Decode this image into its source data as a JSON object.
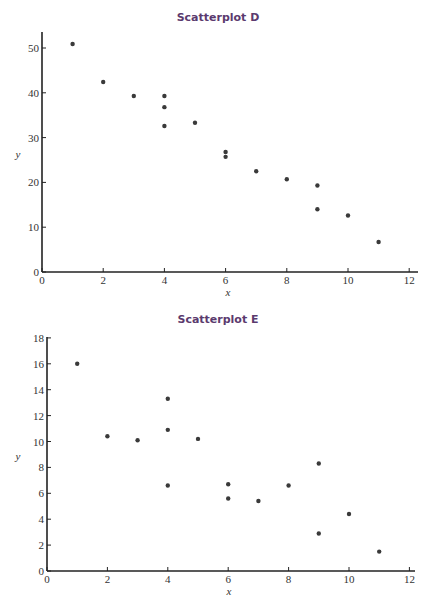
{
  "chart_data": [
    {
      "type": "scatter",
      "title": "Scatterplot D",
      "xlabel": "x",
      "ylabel": "y",
      "xlim": [
        0,
        12
      ],
      "ylim": [
        0,
        53
      ],
      "xticks": [
        0,
        2,
        4,
        6,
        8,
        10,
        12
      ],
      "yticks": [
        0,
        10,
        20,
        30,
        40,
        50
      ],
      "grid": false,
      "points": [
        {
          "x": 1,
          "y": 50.9
        },
        {
          "x": 2,
          "y": 42.4
        },
        {
          "x": 3,
          "y": 39.3
        },
        {
          "x": 4,
          "y": 39.3
        },
        {
          "x": 4,
          "y": 36.8
        },
        {
          "x": 4,
          "y": 32.6
        },
        {
          "x": 5,
          "y": 33.3
        },
        {
          "x": 6,
          "y": 26.8
        },
        {
          "x": 6,
          "y": 25.7
        },
        {
          "x": 7,
          "y": 22.5
        },
        {
          "x": 8,
          "y": 20.7
        },
        {
          "x": 9,
          "y": 19.3
        },
        {
          "x": 9,
          "y": 14.0
        },
        {
          "x": 10,
          "y": 12.6
        },
        {
          "x": 11,
          "y": 6.7
        }
      ]
    },
    {
      "type": "scatter",
      "title": "Scatterplot E",
      "xlabel": "x",
      "ylabel": "y",
      "xlim": [
        0,
        12
      ],
      "ylim": [
        0,
        18
      ],
      "xticks": [
        0,
        2,
        4,
        6,
        8,
        10,
        12
      ],
      "yticks": [
        0,
        2,
        4,
        6,
        8,
        10,
        12,
        14,
        16,
        18
      ],
      "grid": false,
      "points": [
        {
          "x": 1,
          "y": 16.0
        },
        {
          "x": 2,
          "y": 10.4
        },
        {
          "x": 3,
          "y": 10.1
        },
        {
          "x": 4,
          "y": 13.3
        },
        {
          "x": 4,
          "y": 10.9
        },
        {
          "x": 4,
          "y": 6.6
        },
        {
          "x": 5,
          "y": 10.2
        },
        {
          "x": 6,
          "y": 6.7
        },
        {
          "x": 6,
          "y": 5.6
        },
        {
          "x": 7,
          "y": 5.4
        },
        {
          "x": 8,
          "y": 6.6
        },
        {
          "x": 9,
          "y": 8.3
        },
        {
          "x": 9,
          "y": 2.9
        },
        {
          "x": 10,
          "y": 4.4
        },
        {
          "x": 11,
          "y": 1.5
        }
      ]
    }
  ],
  "colors": {
    "title": "#5b3a6e",
    "point": "#3a3a3a",
    "axis": "#222222"
  },
  "layout": [
    {
      "title_top": 11,
      "x0": 42,
      "x_unit": 30.6,
      "y0": 272,
      "y_unit": 4.48,
      "x_end": 418,
      "y_top": 32
    },
    {
      "title_top": 313,
      "x0": 47,
      "x_unit": 30.2,
      "y0": 571,
      "y_unit": 12.95,
      "x_end": 415,
      "y_top": 337
    }
  ]
}
